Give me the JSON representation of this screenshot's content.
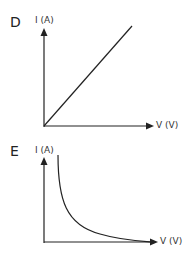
{
  "graphs": [
    {
      "id": "D",
      "label": "D",
      "y_axis_label": "I (A)",
      "x_axis_label": "V (V)",
      "curve": "linear-through-origin"
    },
    {
      "id": "E",
      "label": "E",
      "y_axis_label": "I (A)",
      "x_axis_label": "V (V)",
      "curve": "inverse-decay"
    }
  ],
  "colors": {
    "line": "#222222",
    "background": "#ffffff"
  }
}
